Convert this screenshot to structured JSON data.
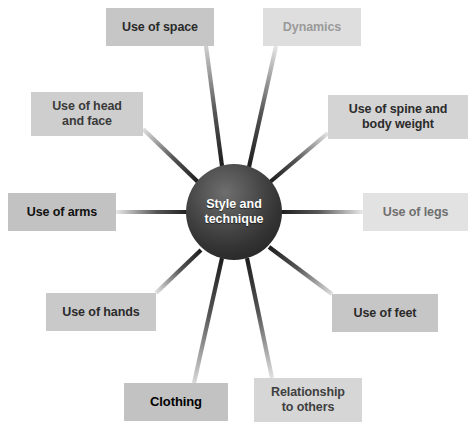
{
  "diagram": {
    "type": "radial-spoke-diagram",
    "title": "Style and technique",
    "hub": {
      "label": "Style and\ntechnique",
      "text_color": "#ffffff",
      "fill_dark": "#202020",
      "fill_light": "#6e6e6e",
      "cx": 234,
      "cy": 212,
      "r": 48
    },
    "canvas": {
      "width": 468,
      "height": 425,
      "background": "#ffffff"
    },
    "nodes": [
      {
        "id": "use-of-space",
        "label": "Use of space",
        "x": 106,
        "y": 8,
        "w": 108,
        "h": 38,
        "bg": "#c6c6c6",
        "text_color": "#2b2b2b",
        "font_size": 12.5,
        "anchor_x": 206,
        "anchor_y": 46
      },
      {
        "id": "dynamics",
        "label": "Dynamics",
        "x": 263,
        "y": 8,
        "w": 98,
        "h": 38,
        "bg": "#dedede",
        "text_color": "#9a9a9a",
        "font_size": 12.5,
        "anchor_x": 276,
        "anchor_y": 46
      },
      {
        "id": "use-of-head-and-face",
        "label": "Use of head\nand face",
        "x": 31,
        "y": 92,
        "w": 112,
        "h": 44,
        "bg": "#cecece",
        "text_color": "#3a3a3a",
        "font_size": 12.5,
        "anchor_x": 143,
        "anchor_y": 129
      },
      {
        "id": "use-of-spine-and-body-weight",
        "label": "Use of spine and\nbody weight",
        "x": 328,
        "y": 95,
        "w": 140,
        "h": 44,
        "bg": "#d4d4d4",
        "text_color": "#2b2b2b",
        "font_size": 12.5,
        "anchor_x": 328,
        "anchor_y": 133
      },
      {
        "id": "use-of-arms",
        "label": "Use of arms",
        "x": 8,
        "y": 193,
        "w": 108,
        "h": 38,
        "bg": "#c2c2c2",
        "text_color": "#111111",
        "font_size": 12.5,
        "anchor_x": 116,
        "anchor_y": 212
      },
      {
        "id": "use-of-legs",
        "label": "Use of legs",
        "x": 363,
        "y": 193,
        "w": 105,
        "h": 38,
        "bg": "#e2e2e2",
        "text_color": "#6f6f6f",
        "font_size": 12.5,
        "anchor_x": 363,
        "anchor_y": 212
      },
      {
        "id": "use-of-hands",
        "label": "Use of hands",
        "x": 46,
        "y": 293,
        "w": 110,
        "h": 38,
        "bg": "#c9c9c9",
        "text_color": "#2b2b2b",
        "font_size": 12.5,
        "anchor_x": 156,
        "anchor_y": 293
      },
      {
        "id": "use-of-feet",
        "label": "Use of feet",
        "x": 332,
        "y": 294,
        "w": 106,
        "h": 38,
        "bg": "#c6c6c6",
        "text_color": "#2b2b2b",
        "font_size": 12.5,
        "anchor_x": 332,
        "anchor_y": 294
      },
      {
        "id": "clothing",
        "label": "Clothing",
        "x": 124,
        "y": 383,
        "w": 104,
        "h": 38,
        "bg": "#c2c2c2",
        "text_color": "#000000",
        "font_size": 13,
        "anchor_x": 194,
        "anchor_y": 383
      },
      {
        "id": "relationship-to-others",
        "label": "Relationship\nto others",
        "x": 254,
        "y": 378,
        "w": 108,
        "h": 44,
        "bg": "#d6d6d6",
        "text_color": "#3f3f3f",
        "font_size": 12.5,
        "anchor_x": 272,
        "anchor_y": 378
      }
    ],
    "spokes": [
      {
        "id": "spoke-use-of-space",
        "from_id": "use-of-space",
        "x1": 206,
        "y1": 46,
        "x2": 222,
        "y2": 166,
        "width": 4.2,
        "light": "#cfcfcf",
        "dark": "#1d1d1d"
      },
      {
        "id": "spoke-dynamics",
        "from_id": "dynamics",
        "x1": 276,
        "y1": 46,
        "x2": 249,
        "y2": 167,
        "width": 4.2,
        "light": "#e6e6e6",
        "dark": "#1d1d1d"
      },
      {
        "id": "spoke-use-of-head-and-face",
        "from_id": "use-of-head-and-face",
        "x1": 143,
        "y1": 129,
        "x2": 198,
        "y2": 182,
        "width": 4.2,
        "light": "#e0e0e0",
        "dark": "#1d1d1d"
      },
      {
        "id": "spoke-use-of-spine-and-body-weight",
        "from_id": "use-of-spine-and-body-weight",
        "x1": 328,
        "y1": 133,
        "x2": 270,
        "y2": 182,
        "width": 4.2,
        "light": "#e4e4e4",
        "dark": "#1d1d1d"
      },
      {
        "id": "spoke-use-of-arms",
        "from_id": "use-of-arms",
        "x1": 116,
        "y1": 212,
        "x2": 190,
        "y2": 212,
        "width": 4.0,
        "light": "#e8e8e8",
        "dark": "#1d1d1d"
      },
      {
        "id": "spoke-use-of-legs",
        "from_id": "use-of-legs",
        "x1": 363,
        "y1": 212,
        "x2": 280,
        "y2": 212,
        "width": 4.0,
        "light": "#eaeaea",
        "dark": "#1d1d1d"
      },
      {
        "id": "spoke-use-of-hands",
        "from_id": "use-of-hands",
        "x1": 156,
        "y1": 293,
        "x2": 201,
        "y2": 250,
        "width": 4.2,
        "light": "#e0e0e0",
        "dark": "#1d1d1d"
      },
      {
        "id": "spoke-use-of-feet",
        "from_id": "use-of-feet",
        "x1": 332,
        "y1": 294,
        "x2": 269,
        "y2": 247,
        "width": 4.2,
        "light": "#dedede",
        "dark": "#1d1d1d"
      },
      {
        "id": "spoke-clothing",
        "from_id": "clothing",
        "x1": 194,
        "y1": 383,
        "x2": 222,
        "y2": 258,
        "width": 4.2,
        "light": "#d8d8d8",
        "dark": "#1d1d1d"
      },
      {
        "id": "spoke-relationship-to-others",
        "from_id": "relationship-to-others",
        "x1": 272,
        "y1": 378,
        "x2": 247,
        "y2": 258,
        "width": 4.2,
        "light": "#e2e2e2",
        "dark": "#1d1d1d"
      }
    ]
  }
}
